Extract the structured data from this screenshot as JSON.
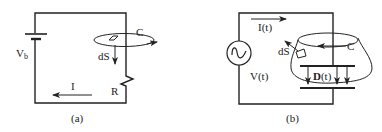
{
  "figure": {
    "panel_a": {
      "caption": "(a)",
      "battery_label": "V",
      "battery_subscript": "b",
      "contour_label": "C",
      "surface_element_label": "dS",
      "resistor_label": "R",
      "current_label": "I"
    },
    "panel_b": {
      "caption": "(b)",
      "source_label": "V(t)",
      "current_label": "I(t)",
      "contour_label": "C",
      "surface_element_label": "dS",
      "field_label_bold": "D",
      "field_label_rest": "(t)"
    }
  }
}
